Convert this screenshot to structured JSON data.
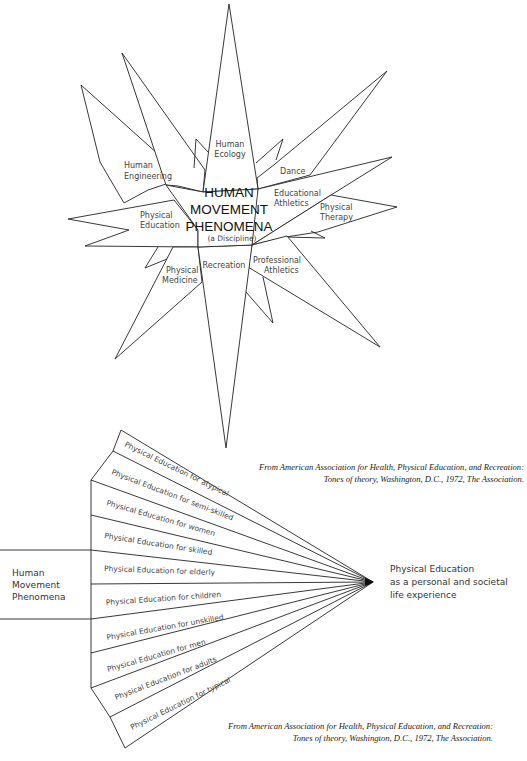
{
  "star": {
    "center_title": [
      "HUMAN",
      "MOVEMENT",
      "PHENOMENA"
    ],
    "center_subtitle": "(a Discipline)",
    "spokes": [
      {
        "label": [
          "Human",
          "Ecology"
        ]
      },
      {
        "label": [
          "Human",
          "Engineering"
        ]
      },
      {
        "label": [
          "Dance"
        ]
      },
      {
        "label": [
          "Educational",
          "Athletics"
        ]
      },
      {
        "label": [
          "Physical",
          "Therapy"
        ]
      },
      {
        "label": [
          "Physical",
          "Education"
        ]
      },
      {
        "label": [
          "Physical",
          "Medicine"
        ]
      },
      {
        "label": [
          "Recreation"
        ]
      },
      {
        "label": [
          "Professional",
          "Athletics"
        ]
      }
    ]
  },
  "citation_top": {
    "line1": "From American Association for Health, Physical Education, and Recreation:",
    "line2": "Tones of theory, Washington, D.C., 1972, The Association."
  },
  "fan": {
    "source_label": [
      "Human",
      "Movement",
      "Phenomena"
    ],
    "target_label": [
      "Physical Education",
      "as a personal and societal",
      "life experience"
    ],
    "segments": [
      "Physical Education for atypical",
      "Physical Education for semi-skilled",
      "Physical Education for women",
      "Physical Education for skilled",
      "Physical Education for elderly",
      "Physical Education for children",
      "Physical Education for unskilled",
      "Physical Education for men",
      "Physical Education for adults",
      "Physical Education for typical"
    ]
  },
  "citation_bottom": {
    "line1": "From American Association for Health, Physical Education, and Recreation:",
    "line2": "Tones of theory, Washington, D.C., 1972, The Association."
  }
}
